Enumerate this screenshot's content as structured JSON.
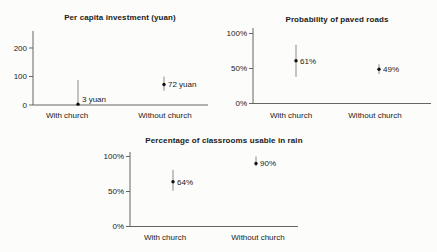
{
  "page": {
    "background": "#fcfcfa",
    "text_color": "#1a1a1a",
    "axis_color": "#555555",
    "error_bar_color": "#8a8a8a",
    "point_color": "#111111"
  },
  "chart_data": [
    {
      "id": "per-capita-investment",
      "type": "scatter",
      "title": "Per capita investment (yuan)",
      "categories": [
        "With church",
        "Without church"
      ],
      "series": [
        {
          "name": "point-estimate",
          "values": [
            3,
            72
          ],
          "labels": [
            "3 yuan",
            "72 yuan"
          ],
          "ci_low": [
            0,
            50
          ],
          "ci_high": [
            88,
            100
          ]
        }
      ],
      "xlabel": "",
      "ylabel": "",
      "yticks": [
        0,
        100,
        200
      ],
      "ytick_labels": [
        "0",
        "100",
        "200"
      ],
      "ylim": [
        0,
        260
      ],
      "grid": false,
      "legend": false
    },
    {
      "id": "probability-of-paved-roads",
      "type": "scatter",
      "title": "Probability of paved roads",
      "categories": [
        "With church",
        "Without church"
      ],
      "series": [
        {
          "name": "point-estimate",
          "values": [
            61,
            49
          ],
          "labels": [
            "61%",
            "49%"
          ],
          "ci_low": [
            38,
            42
          ],
          "ci_high": [
            84,
            56
          ]
        }
      ],
      "xlabel": "",
      "ylabel": "",
      "yticks": [
        0,
        50,
        100
      ],
      "ytick_labels": [
        "0%",
        "50%",
        "100%"
      ],
      "ylim": [
        0,
        108
      ],
      "grid": false,
      "legend": false
    },
    {
      "id": "classrooms-usable-in-rain",
      "type": "scatter",
      "title": "Percentage of classrooms usable in rain",
      "categories": [
        "With church",
        "Without church"
      ],
      "series": [
        {
          "name": "point-estimate",
          "values": [
            64,
            90
          ],
          "labels": [
            "64%",
            "90%"
          ],
          "ci_low": [
            51,
            86
          ],
          "ci_high": [
            81,
            100
          ]
        }
      ],
      "xlabel": "",
      "ylabel": "",
      "yticks": [
        0,
        50,
        100
      ],
      "ytick_labels": [
        "0%",
        "50%",
        "100%"
      ],
      "ylim": [
        0,
        106
      ],
      "grid": false,
      "legend": false
    }
  ]
}
